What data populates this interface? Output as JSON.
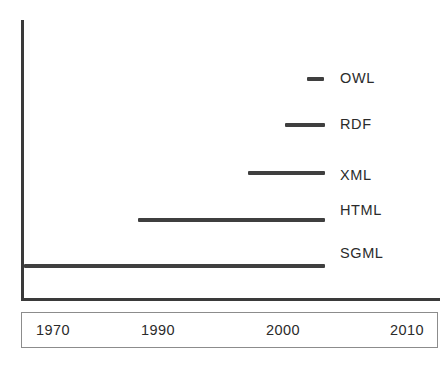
{
  "chart_data": {
    "type": "bar",
    "orientation": "horizontal",
    "title": "",
    "subtitle": "",
    "xlabel": "",
    "ylabel": "",
    "xlim": [
      1964,
      2014
    ],
    "grid": false,
    "legend_position": "right-inline",
    "tick_labels": [
      "1970",
      "1990",
      "2000",
      "2010"
    ],
    "tick_values": [
      1970,
      1990,
      2000,
      2010
    ],
    "categories": [
      "OWL",
      "RDF",
      "XML",
      "HTML",
      "SGML"
    ],
    "series": [
      {
        "name": "OWL",
        "label": "OWL",
        "start": 2002,
        "end": 2004,
        "bar_px": {
          "left": 307,
          "width": 17,
          "top": 77
        },
        "label_px": {
          "top": 71
        }
      },
      {
        "name": "RDF",
        "label": "RDF",
        "start": 1997,
        "end": 2004,
        "bar_px": {
          "left": 285,
          "width": 40,
          "top": 123
        },
        "label_px": {
          "top": 117
        }
      },
      {
        "name": "XML",
        "label": "XML",
        "start": 1993,
        "end": 2004,
        "bar_px": {
          "left": 248,
          "width": 77,
          "top": 171
        },
        "label_px": {
          "top": 168
        }
      },
      {
        "name": "HTML",
        "label": "HTML",
        "start": 1989,
        "end": 2004,
        "bar_px": {
          "left": 138,
          "width": 187,
          "top": 218
        },
        "label_px": {
          "top": 203
        }
      },
      {
        "name": "SGML",
        "label": "SGML",
        "start": 1966,
        "end": 2004,
        "bar_px": {
          "left": 24,
          "width": 301,
          "top": 264
        },
        "label_px": {
          "top": 246
        }
      }
    ],
    "tick_px": [
      {
        "label": "1970",
        "x": 52
      },
      {
        "label": "1990",
        "x": 157
      },
      {
        "label": "2000",
        "x": 282
      },
      {
        "label": "2010",
        "x": 406
      }
    ],
    "colors": {
      "bar": "#3f3f3f",
      "axis": "#3a3a3a",
      "text": "#2b2b2b",
      "box_border": "#8c8c8c",
      "background": "#ffffff"
    }
  }
}
